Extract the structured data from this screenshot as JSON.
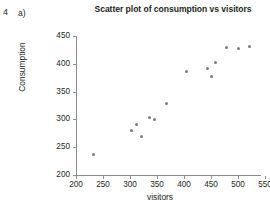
{
  "question": {
    "number": "4",
    "part": "a)"
  },
  "chart_data": {
    "type": "scatter",
    "title": "Scatter plot of consumption vs visitors",
    "xlabel": "visitors",
    "ylabel": "Consumption",
    "xlim": [
      200,
      550
    ],
    "ylim": [
      200,
      450
    ],
    "xticks": [
      200,
      250,
      300,
      350,
      400,
      450,
      500,
      550
    ],
    "yticks": [
      200,
      250,
      300,
      350,
      400,
      450
    ],
    "grid": false,
    "legend": null,
    "marker_color": "#7c7c7c",
    "axis_color": "#8c8c8c",
    "x": [
      233,
      303,
      312,
      322,
      337,
      345,
      368,
      405,
      443,
      450,
      458,
      478,
      500,
      521
    ],
    "y": [
      237,
      280,
      291,
      270,
      303,
      300,
      328,
      387,
      392,
      377,
      403,
      430,
      428,
      431
    ],
    "points": [
      {
        "x": 233,
        "y": 237
      },
      {
        "x": 303,
        "y": 280
      },
      {
        "x": 312,
        "y": 291
      },
      {
        "x": 322,
        "y": 270
      },
      {
        "x": 337,
        "y": 303
      },
      {
        "x": 345,
        "y": 300
      },
      {
        "x": 368,
        "y": 328
      },
      {
        "x": 405,
        "y": 387
      },
      {
        "x": 443,
        "y": 392
      },
      {
        "x": 450,
        "y": 377
      },
      {
        "x": 458,
        "y": 403
      },
      {
        "x": 478,
        "y": 430
      },
      {
        "x": 500,
        "y": 428
      },
      {
        "x": 521,
        "y": 431
      }
    ]
  }
}
